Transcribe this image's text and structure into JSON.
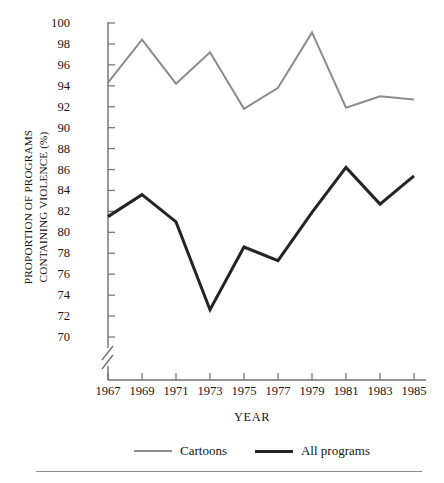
{
  "chart_data": {
    "type": "line",
    "title": "",
    "xlabel": "YEAR",
    "ylabel": "PROPORTION OF PROGRAMS CONTAINING VIOLENCE (%)",
    "ylabel_lines": [
      "PROPORTION OF PROGRAMS",
      "CONTAINING VIOLENCE (%)"
    ],
    "categories": [
      1967,
      1969,
      1971,
      1973,
      1975,
      1977,
      1979,
      1981,
      1983,
      1985
    ],
    "x_tick_labels": [
      "1967",
      "1969",
      "1971",
      "1973",
      "1975",
      "1977",
      "1979",
      "1981",
      "1983",
      "1985"
    ],
    "y_tick_labels": [
      "100",
      "98",
      "96",
      "94",
      "92",
      "90",
      "88",
      "86",
      "84",
      "82",
      "80",
      "78",
      "76",
      "74",
      "72",
      "70"
    ],
    "y_ticks": [
      100,
      98,
      96,
      94,
      92,
      90,
      88,
      86,
      84,
      82,
      80,
      78,
      76,
      74,
      72,
      70
    ],
    "ylim": [
      70,
      100
    ],
    "xlim": [
      1967,
      1985
    ],
    "axis_break": true,
    "grid": false,
    "legend_position": "bottom",
    "series": [
      {
        "name": "Cartoons",
        "color": "#8c8c8c",
        "width": 2,
        "values": [
          94.3,
          98.4,
          94.2,
          97.2,
          91.8,
          93.8,
          99.1,
          91.9,
          93.0,
          92.7
        ]
      },
      {
        "name": "All programs",
        "color": "#242424",
        "width": 3,
        "values": [
          81.5,
          83.6,
          81.0,
          72.6,
          78.6,
          77.3,
          81.9,
          86.2,
          82.7,
          85.4
        ]
      }
    ]
  },
  "legend": {
    "entries": [
      {
        "label": "Cartoons",
        "swatch": "thin-gray-line"
      },
      {
        "label": "All programs",
        "swatch": "thick-black-line"
      }
    ]
  },
  "axes": {
    "x_title": "YEAR",
    "y_title_line1": "PROPORTION OF PROGRAMS",
    "y_title_line2": "CONTAINING VIOLENCE (%)"
  },
  "colors": {
    "cartoons": "#8c8c8c",
    "all_programs": "#242424",
    "axis": "#6f6f6f",
    "text": "#161616"
  }
}
